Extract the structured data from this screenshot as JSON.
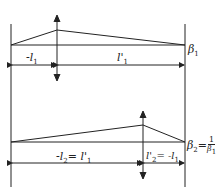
{
  "diagram": {
    "top": {
      "segment_left_label": "-l",
      "segment_left_sub": "1",
      "segment_right_label": "l'",
      "segment_right_sub": "1",
      "magnification_label": "β",
      "magnification_sub": "1"
    },
    "bottom": {
      "segment_left_label": "-l",
      "segment_left_sub": "2",
      "segment_left_eq": "= l'",
      "segment_left_eq_sub": "1",
      "segment_right_label": "l'",
      "segment_right_sub": "2",
      "segment_right_eq": "= -l",
      "segment_right_eq_sub": "1",
      "magnification_label": "β",
      "magnification_sub": "2",
      "magnification_eq": "=",
      "frac_num": "1",
      "frac_den": "β",
      "frac_den_sub": "1"
    }
  }
}
